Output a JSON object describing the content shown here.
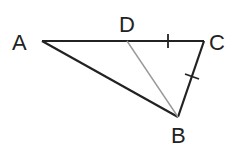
{
  "diagram": {
    "type": "geometry-triangle",
    "points": {
      "A": {
        "label": "A",
        "x": 42,
        "y": 41
      },
      "D": {
        "label": "D",
        "x": 127,
        "y": 41
      },
      "C": {
        "label": "C",
        "x": 204,
        "y": 41
      },
      "B": {
        "label": "B",
        "x": 178,
        "y": 117
      }
    },
    "segments": [
      {
        "from": "A",
        "to": "C",
        "style": "solid"
      },
      {
        "from": "C",
        "to": "B",
        "style": "solid"
      },
      {
        "from": "A",
        "to": "B",
        "style": "solid"
      },
      {
        "from": "D",
        "to": "B",
        "style": "thin-gray"
      }
    ],
    "equal_marks": [
      "DC",
      "CB"
    ],
    "colors": {
      "line": "#222222",
      "aux_line": "#999999"
    }
  }
}
